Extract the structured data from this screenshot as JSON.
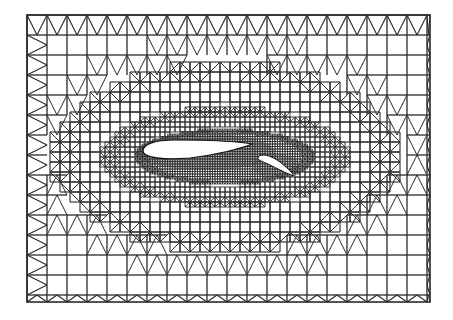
{
  "figure": {
    "title": "",
    "description": "Hierarchical hybrid quadrilateral/triangular mesh around a two-element airfoil (main wing + flap)",
    "colors": {
      "background": "#ffffff",
      "line": "#2a2a2a",
      "airfoil_fill": "#ffffff"
    },
    "domain": {
      "x0": 27,
      "y0": 15,
      "x1": 430,
      "y1": 302
    },
    "levels": [
      {
        "name": "level-0",
        "cell": 20,
        "rx": 999,
        "ry": 999
      },
      {
        "name": "level-1",
        "cell": 10,
        "rx": 175,
        "ry": 95
      },
      {
        "name": "level-2",
        "cell": 5,
        "rx": 125,
        "ry": 50
      },
      {
        "name": "level-3",
        "cell": 2.5,
        "rx": 90,
        "ry": 28
      }
    ],
    "refinement_center": {
      "cx": 225,
      "cy": 157
    },
    "main_element": {
      "label": "main airfoil",
      "path": "M143,151 C143,144 155,140 175,140 C205,140 235,141 252,144 C240,149 215,155 190,158 C165,160 143,158 143,151 Z"
    },
    "flap_element": {
      "label": "flap",
      "path": "M258,157 C262,153 270,155 280,162 C286,167 292,172 294,176 C288,174 278,169 268,164 C261,161 257,160 258,157 Z"
    }
  }
}
